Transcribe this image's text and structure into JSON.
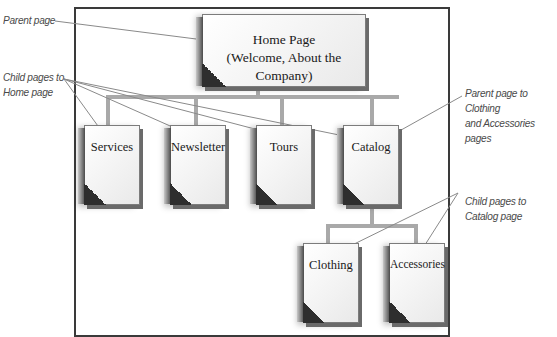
{
  "diagram": {
    "type": "site-hierarchy",
    "nodes": {
      "home": {
        "line1": "Home Page",
        "line2": "(Welcome, About the Company)"
      },
      "services": {
        "label": "Services"
      },
      "newsletter": {
        "label": "Newsletter"
      },
      "tours": {
        "label": "Tours"
      },
      "catalog": {
        "label": "Catalog"
      },
      "clothing": {
        "label": "Clothing"
      },
      "accessories": {
        "label": "Accessories"
      }
    },
    "edges": [
      [
        "home",
        "services"
      ],
      [
        "home",
        "newsletter"
      ],
      [
        "home",
        "tours"
      ],
      [
        "home",
        "catalog"
      ],
      [
        "catalog",
        "clothing"
      ],
      [
        "catalog",
        "accessories"
      ]
    ],
    "callouts": {
      "parent_page": "Parent page",
      "child_home": {
        "line1": "Child pages to",
        "line2": "Home page"
      },
      "parent_catalog": {
        "line1": "Parent page to Clothing",
        "line2": "and Accessories pages"
      },
      "child_catalog": {
        "line1": "Child pages to",
        "line2": "Catalog page"
      }
    },
    "colors": {
      "frame": "#3a3a3a",
      "connector": "#a8a8a8",
      "leader": "#8a8a8a",
      "callout_text": "#4a4a4a",
      "page_corner": "#2e2e2e"
    }
  }
}
